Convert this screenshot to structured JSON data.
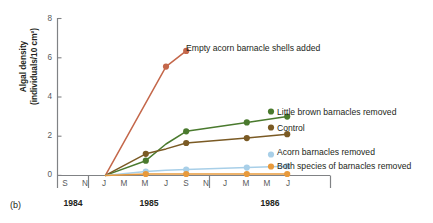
{
  "panel": {
    "label": "(b)"
  },
  "axes": {
    "y": {
      "title_line1": "Algal density",
      "title_line2": "(individuals/10 cm²)",
      "ticks": [
        "0",
        "2",
        "4",
        "6",
        "8"
      ],
      "tick_values": [
        0,
        2,
        4,
        6,
        8
      ],
      "min": 0,
      "max": 8
    },
    "x": {
      "tick_labels": [
        "S",
        "N",
        "J",
        "M",
        "M",
        "J",
        "S",
        "N",
        "J",
        "M",
        "M",
        "J"
      ],
      "year_groups": [
        {
          "label": "1984"
        },
        {
          "label": "1985"
        },
        {
          "label": "1986"
        }
      ]
    }
  },
  "chart_data": {
    "type": "line",
    "title": "",
    "xlabel": "",
    "ylabel": "Algal density (individuals/10 cm²)",
    "ylim": [
      0,
      8
    ],
    "grid": false,
    "legend_position": "inline-right",
    "x": [
      "S 1984",
      "N 1984",
      "J 1985",
      "M 1985",
      "M 1985",
      "J 1985",
      "S 1985",
      "N 1985",
      "J 1986",
      "M 1986",
      "M 1986",
      "J 1986"
    ],
    "series": [
      {
        "name": "Empty acorn barnacle shells added",
        "color": "#c4674a",
        "values": [
          null,
          null,
          0.0,
          null,
          null,
          5.55,
          6.35,
          null,
          null,
          null,
          null,
          null
        ],
        "markers": [
          null,
          null,
          false,
          null,
          null,
          true,
          true,
          null,
          null,
          null,
          null,
          null
        ]
      },
      {
        "name": "Little brown barnacles removed",
        "color": "#4a7a2e",
        "values": [
          null,
          null,
          0.0,
          null,
          0.75,
          1.6,
          2.25,
          null,
          null,
          2.7,
          null,
          3.0
        ],
        "markers": [
          null,
          null,
          false,
          null,
          true,
          false,
          true,
          null,
          null,
          true,
          null,
          true
        ]
      },
      {
        "name": "Control",
        "color": "#7a5a24",
        "values": [
          null,
          null,
          0.0,
          null,
          1.1,
          1.35,
          1.65,
          null,
          null,
          1.9,
          null,
          2.1
        ],
        "markers": [
          null,
          null,
          false,
          null,
          true,
          false,
          true,
          null,
          null,
          true,
          null,
          true
        ]
      },
      {
        "name": "Acorn barnacles removed",
        "color": "#a8cfe8",
        "values": [
          null,
          null,
          0.0,
          null,
          0.2,
          0.26,
          0.3,
          null,
          null,
          0.4,
          null,
          0.47
        ],
        "markers": [
          null,
          null,
          false,
          null,
          true,
          false,
          true,
          null,
          null,
          true,
          null,
          true
        ]
      },
      {
        "name": "Both species of barnacles removed",
        "color": "#e89a3c",
        "values": [
          null,
          null,
          0.0,
          null,
          0.07,
          0.07,
          0.07,
          null,
          null,
          0.07,
          null,
          0.07
        ],
        "markers": [
          null,
          null,
          false,
          null,
          true,
          false,
          true,
          null,
          null,
          true,
          null,
          true
        ]
      }
    ]
  },
  "annotations": [
    {
      "text": "Empty acorn barnacle shells added",
      "series": "Empty acorn barnacle shells added"
    },
    {
      "text": "Little brown barnacles removed",
      "series": "Little brown barnacles removed"
    },
    {
      "text": "Control",
      "series": "Control"
    },
    {
      "text": "Acorn barnacles removed",
      "series": "Acorn barnacles removed"
    },
    {
      "text": "Both species of barnacles removed",
      "series": "Both species of barnacles removed"
    }
  ]
}
